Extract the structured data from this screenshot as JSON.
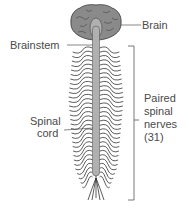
{
  "diagram": {
    "type": "anatomy",
    "labels": {
      "brain": "Brain",
      "brainstem": "Brainstem",
      "spinal_cord_line1": "Spinal",
      "spinal_cord_line2": "cord",
      "nerves_line1": "Paired",
      "nerves_line2": "spinal",
      "nerves_line3": "nerves",
      "nerves_line4": "(31)"
    },
    "colors": {
      "brain_fill": "#8a8a8a",
      "cord_fill": "#b0b0b0",
      "nerve_stroke": "#333333",
      "label_line": "#555555"
    }
  }
}
